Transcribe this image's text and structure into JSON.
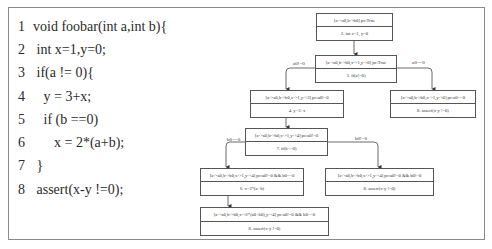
{
  "code": {
    "lines": [
      {
        "num": "1",
        "text": "void foobar(int a,int b){"
      },
      {
        "num": "2",
        "text": " int x=1,y=0;"
      },
      {
        "num": "3",
        "text": " if(a != 0){"
      },
      {
        "num": "4",
        "text": "   y = 3+x;"
      },
      {
        "num": "5",
        "text": "   if (b ==0)"
      },
      {
        "num": "6",
        "text": "      x = 2*(a+b);"
      },
      {
        "num": "7",
        "text": " }"
      },
      {
        "num": "8",
        "text": " assert(x-y !=0);"
      }
    ]
  },
  "diagram": {
    "nodes": [
      {
        "id": "n1",
        "state": "[a->a0,b->b0] pc:True",
        "stmt": "2. int x=1, y=0"
      },
      {
        "id": "n2",
        "state": "[a->a0,b->b0,x->1,y->0] pc:True",
        "stmt": "3. if(a!=0)"
      },
      {
        "id": "n3",
        "state": "[a->a0,b->b0,x->1,y->3] pc:a0!=0",
        "stmt": "4. y=3+x"
      },
      {
        "id": "n4",
        "state": "[a->a0,b->b0,x->1,y->0] pc:a0==0",
        "stmt": "8. assert(x-y !=0)"
      },
      {
        "id": "n5",
        "state": "[a->a0,b->b0,x->1,y->4] pc:a0!=0",
        "stmt": "7. if(b==0)"
      },
      {
        "id": "n6",
        "state": "[a->a0,b->b0,x->1,y->4] pc:a0!=0 && b0==0",
        "stmt": "6. x=2*(a+b)"
      },
      {
        "id": "n7",
        "state": "[a->a0,b->b0,x->1,y->4] pc:a0!=0 && b0!=0",
        "stmt": "8. assert(x-y !=0)"
      },
      {
        "id": "n8",
        "state": "[a->a0,b->b0,x->2*(a0+b0),y->4] pc:a0!=0 && b0==0",
        "stmt": "8. assert(x-y !=0)"
      }
    ],
    "edge_labels": {
      "a_ne_0": "a0!=0",
      "a_eq_0": "a0==0",
      "b_eq_0": "b0==0",
      "b_ne_0": "b0!=0"
    }
  }
}
